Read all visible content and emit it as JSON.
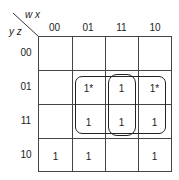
{
  "kmap": {
    "col_var": "w x",
    "row_var": "y z",
    "col_labels": [
      "00",
      "01",
      "11",
      "10"
    ],
    "row_labels": [
      "00",
      "01",
      "11",
      "10"
    ],
    "cells": [
      [
        "",
        "",
        "",
        ""
      ],
      [
        "",
        "1*",
        "1",
        "1*"
      ],
      [
        "",
        "1",
        "1",
        "1"
      ],
      [
        "1",
        "1",
        "",
        "1"
      ]
    ],
    "groups": [
      {
        "name": "quad-rows-01-11-cols-01-11-10",
        "rows": [
          1,
          2
        ],
        "cols": [
          1,
          2,
          3
        ]
      },
      {
        "name": "pair-col-11-rows-01-11",
        "rows": [
          1,
          2
        ],
        "cols": [
          2
        ]
      }
    ]
  }
}
